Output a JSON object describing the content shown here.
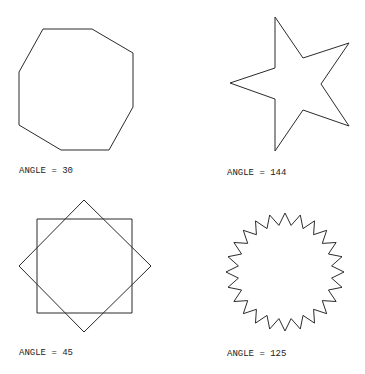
{
  "figures": [
    {
      "id": "octagon",
      "label": "ANGLE = 30",
      "label_pos": [
        19,
        166
      ],
      "shape": "polygon",
      "points": [
        [
          43,
          29
        ],
        [
          92,
          29
        ],
        [
          133,
          53
        ],
        [
          133,
          107
        ],
        [
          109,
          150
        ],
        [
          61,
          150
        ],
        [
          19,
          125
        ],
        [
          19,
          72
        ]
      ]
    },
    {
      "id": "star",
      "label": "ANGLE = 144",
      "label_pos": [
        227,
        168
      ],
      "shape": "polygon",
      "points": [
        [
          275,
          17
        ],
        [
          303,
          58
        ],
        [
          349,
          43
        ],
        [
          321,
          84
        ],
        [
          349,
          126
        ],
        [
          303,
          110
        ],
        [
          275,
          151
        ],
        [
          275,
          99
        ],
        [
          230,
          83
        ],
        [
          275,
          68
        ]
      ]
    },
    {
      "id": "square-diamond",
      "label": "ANGLE = 45",
      "label_pos": [
        19,
        348
      ],
      "shape": "two-squares",
      "square": [
        [
          37,
          219
        ],
        [
          132,
          219
        ],
        [
          132,
          313
        ],
        [
          37,
          313
        ]
      ],
      "diamond": [
        [
          84,
          200
        ],
        [
          151,
          266
        ],
        [
          84,
          332
        ],
        [
          19,
          266
        ]
      ]
    },
    {
      "id": "zigzag-circle",
      "label": "ANGLE = 125",
      "label_pos": [
        227,
        349
      ],
      "shape": "zigzag",
      "center": [
        285,
        272
      ],
      "outer_radius": 59,
      "inner_radius": 47,
      "spikes": 24
    }
  ],
  "colors": {
    "stroke": "#2a2a2a",
    "background": "#ffffff",
    "text": "#222222"
  }
}
